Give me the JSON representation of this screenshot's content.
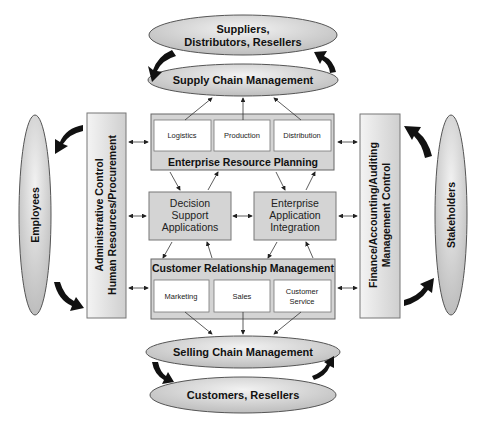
{
  "diagram": {
    "top_ellipses": {
      "suppliers": "Suppliers,",
      "suppliers_line2": "Distributors, Resellers",
      "supply_chain": "Supply Chain Management"
    },
    "erp": {
      "title": "Enterprise Resource Planning",
      "modules": [
        "Logistics",
        "Production",
        "Distribution"
      ]
    },
    "middle": {
      "dss": [
        "Decision",
        "Support",
        "Applications"
      ],
      "eai": [
        "Enterprise",
        "Application",
        "Integration"
      ]
    },
    "crm": {
      "title": "Customer Relationship Management",
      "modules": [
        "Marketing",
        "Sales",
        "Customer",
        "Service"
      ]
    },
    "bottom_ellipses": {
      "selling_chain": "Selling Chain Management",
      "customers": "Customers, Resellers"
    },
    "left": {
      "employees": "Employees",
      "admin_line1": "Administrative Control",
      "admin_line2": "Human Resources/Procurement"
    },
    "right": {
      "stakeholders": "Stakeholders",
      "finance_line1": "Finance/Accounting/Auditing",
      "finance_line2": "Management Control"
    },
    "colors": {
      "box_fill": "#d4d4d4",
      "inner_box_fill": "#ffffff",
      "ellipse_fill": "#d8d8d8",
      "stroke": "#555555",
      "arrow": "#111111"
    }
  }
}
